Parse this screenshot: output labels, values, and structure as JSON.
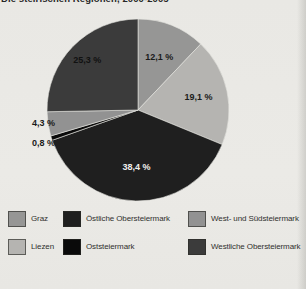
{
  "title": "Die steirischen Regionen, 2000-2005",
  "background_color": "#e9e8e4",
  "chart_data": {
    "type": "pie",
    "title": "Die steirischen Regionen, 2000-2005",
    "direction": "clockwise",
    "start_angle_deg": 0,
    "legend_position": "bottom",
    "value_unit": "%",
    "slices": [
      {
        "id": "graz",
        "name": "Graz",
        "value": 12.1,
        "label": "12,1 %",
        "color": "#969695",
        "label_color": "#1b1b1b"
      },
      {
        "id": "liezen",
        "name": "Liezen",
        "value": 19.1,
        "label": "19,1 %",
        "color": "#b5b4b1",
        "label_color": "#1b1b1b"
      },
      {
        "id": "oestliche-obersteiermark",
        "name": "Östliche Obersteiermark",
        "value": 38.4,
        "label": "38,4 %",
        "color": "#1f1f1f",
        "label_color": "#f0efec"
      },
      {
        "id": "oststeiermark",
        "name": "Oststeiermark",
        "value": 0.8,
        "label": "0,8 %",
        "color": "#0a0a0a",
        "label_color": "#1b1b1b"
      },
      {
        "id": "west-und-suedsteiermark",
        "name": "West- und Südsteiermark",
        "value": 4.3,
        "label": "4,3 %",
        "color": "#929292",
        "label_color": "#1b1b1b"
      },
      {
        "id": "westliche-obersteiermark",
        "name": "Westliche Obersteiermark",
        "value": 25.3,
        "label": "25,3 %",
        "color": "#3b3b3b",
        "label_color": "#111111"
      }
    ]
  },
  "legend": {
    "items": [
      {
        "id": "graz",
        "label": "Graz",
        "color": "#969695"
      },
      {
        "id": "oestliche-obersteiermark",
        "label": "Östliche Obersteiermark",
        "color": "#1f1f1f"
      },
      {
        "id": "west-und-suedsteiermark",
        "label": "West- und Südsteiermark",
        "color": "#929292"
      },
      {
        "id": "liezen",
        "label": "Liezen",
        "color": "#b5b4b1"
      },
      {
        "id": "oststeiermark",
        "label": "Oststeiermark",
        "color": "#0a0a0a"
      },
      {
        "id": "westliche-obersteiermark",
        "label": "Westliche Obersteiermark",
        "color": "#3b3b3b"
      }
    ]
  }
}
